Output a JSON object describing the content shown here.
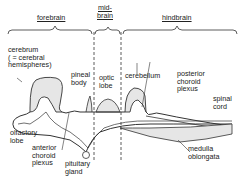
{
  "diagram": {
    "type": "anatomical section of vertebrate brain (side view)",
    "regions": [
      {
        "id": "forebrain",
        "label": "forebrain"
      },
      {
        "id": "midbrain",
        "label": "mid-\nbrain"
      },
      {
        "id": "hindbrain",
        "label": "hindbrain"
      }
    ],
    "labels": {
      "cerebrum": "cerebrum\n( = cerebral\nhemispheres)",
      "pineal_body": "pineal\nbody",
      "optic_lobe": "optic\nlobe",
      "cerebellum": "cerebellum",
      "posterior_choroid_plexus": "posterior\nchoroid\nplexus",
      "spinal_cord": "spinal\ncord",
      "olfactory_lobe": "olfactory\nlobe",
      "anterior_choroid_plexus": "anterior\nchoroid\nplexus",
      "pituitary_gland": "pituitary\ngland",
      "medulla_oblongata": "medulla\noblongata"
    },
    "colors": {
      "line": "#333333",
      "fill": "#e6e6e6",
      "background": "#ffffff"
    }
  }
}
